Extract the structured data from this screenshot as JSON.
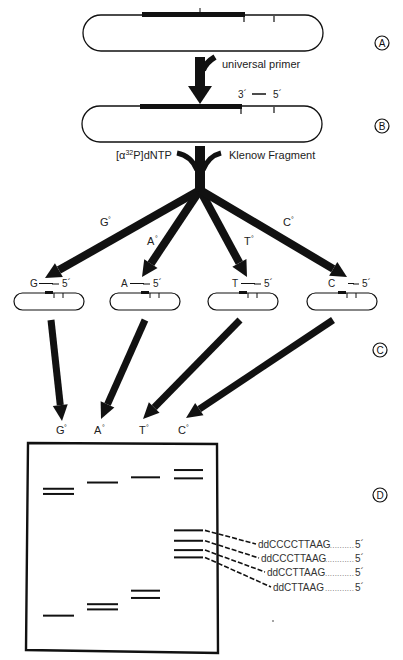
{
  "figure": {
    "steps": [
      {
        "id": "A",
        "label": "A"
      },
      {
        "id": "B",
        "label": "B"
      },
      {
        "id": "C",
        "label": "C"
      },
      {
        "id": "D",
        "label": "D"
      }
    ],
    "step_a": {
      "arrow_label": "universal primer"
    },
    "step_b": {
      "primer_3_label": "3´",
      "primer_5_label": "5´",
      "reagent_left": "dNTP",
      "reagent_left_prefix": "[α",
      "reagent_left_sup": "32",
      "reagent_left_mid": "P]",
      "reagent_right": "Klenow Fragment"
    },
    "reactions": [
      {
        "base": "G",
        "branch_label": "G",
        "ddntp_marker": "°",
        "strand_base": "G",
        "five_prime": "5´",
        "lane_label": "G"
      },
      {
        "base": "A",
        "branch_label": "A",
        "ddntp_marker": "°",
        "strand_base": "A",
        "five_prime": "5´",
        "lane_label": "A"
      },
      {
        "base": "T",
        "branch_label": "T",
        "ddntp_marker": "°",
        "strand_base": "T",
        "five_prime": "5´",
        "lane_label": "T"
      },
      {
        "base": "C",
        "branch_label": "C",
        "ddntp_marker": "°",
        "strand_base": "C",
        "five_prime": "5´",
        "lane_label": "C"
      }
    ],
    "gel": {
      "lanes": [
        "G",
        "A",
        "T",
        "C"
      ],
      "bands_relative_migration": {
        "G": [
          0.22,
          0.245,
          0.83
        ],
        "A": [
          0.19,
          0.775,
          0.8
        ],
        "T": [
          0.165,
          0.71,
          0.745
        ],
        "C": [
          0.13,
          0.17,
          0.42,
          0.47,
          0.515,
          0.55
        ]
      },
      "annotations": [
        {
          "sequence": "ddCCCCTTAAG",
          "dots": "............",
          "five_prime": "5´"
        },
        {
          "sequence": "ddCCCTTAAG",
          "dots": "............",
          "five_prime": "5´"
        },
        {
          "sequence": "ddCCTTAAG",
          "dots": "............",
          "five_prime": "5´"
        },
        {
          "sequence": "ddCTTAAG",
          "dots": "............",
          "five_prime": "5´"
        }
      ]
    },
    "colors": {
      "ink": "#111111",
      "background": "#ffffff"
    }
  }
}
